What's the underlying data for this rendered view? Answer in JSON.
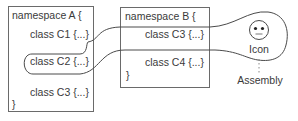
{
  "namespace_a": {
    "header": "namespace A {",
    "classes": [
      "class C1 {...}",
      "class C2 {...}",
      "class C3 {...}"
    ],
    "footer": "}"
  },
  "namespace_b": {
    "header": "namespace B {",
    "classes": [
      "class C3 {...}",
      "class C4 {...}"
    ],
    "footer": "}"
  },
  "icon": {
    "label": "Icon"
  },
  "assembly": {
    "label": "Assembly"
  }
}
